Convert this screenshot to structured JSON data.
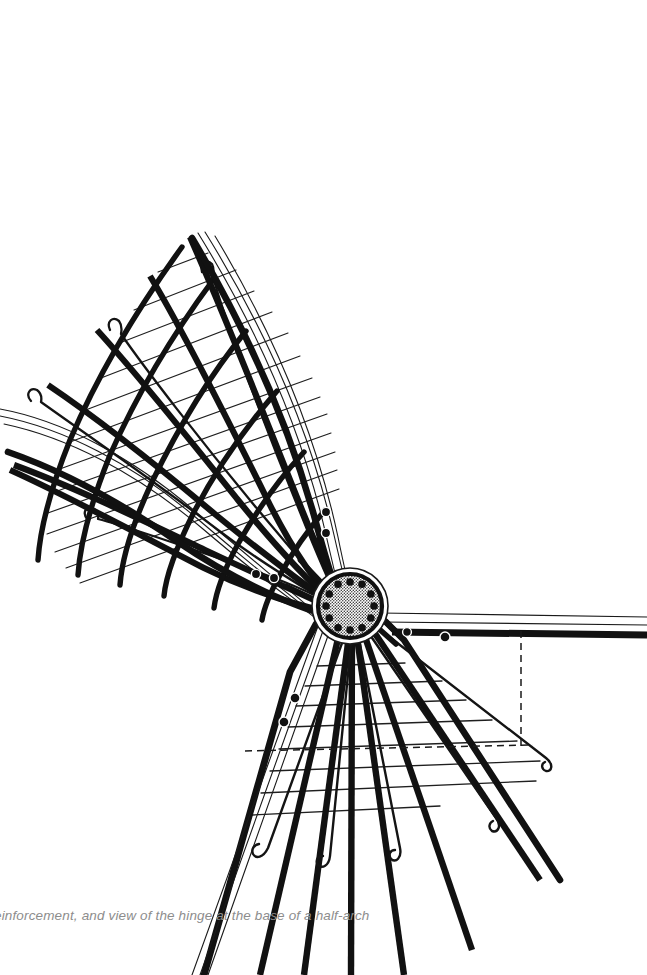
{
  "figure": {
    "caption": "einforcement, and view of the hinge at the base of a half-arch",
    "caption_clipped_left": true,
    "background_color": "#ffffff",
    "ink_color": "#111111",
    "thin_line_color": "#1a1a1a",
    "caption_color": "#8d8d8d",
    "canvas": {
      "width": 647,
      "height": 975
    }
  },
  "hinge": {
    "label": "pin-hinge-plate",
    "center_x": 350,
    "center_y": 606,
    "outer_radius": 37,
    "inner_radius": 30,
    "ring_thickness": 4,
    "bolt_count": 12,
    "bolt_radius": 3.6,
    "bolt_circle_radius": 23,
    "fill_pattern": "stipple-hatch",
    "fill_color": "#d8d8d8"
  },
  "upper_fan": {
    "label": "upper-half-arch-reinforcement-cage",
    "bar_count_radial": 7,
    "tie_count": 13,
    "hooked_bar_count": 5,
    "direction": "upper-left",
    "description": "Splayed fan of main reinforcement bars with transverse ties"
  },
  "lower_fan": {
    "label": "lower-half-arch-reinforcement-cage",
    "bar_count_radial": 8,
    "tie_count": 8,
    "hooked_bar_count": 5,
    "direction": "lower",
    "description": "Splayed fan of main reinforcement bars with horizontal ties"
  },
  "right_beam": {
    "label": "horizontal-tie-beam",
    "start_x": 392,
    "end_x": 647,
    "y": 628,
    "thickness": 7
  },
  "dashed_lines": {
    "horizontal": {
      "x1": 245,
      "y1": 751,
      "x2": 533,
      "y2": 745
    },
    "vertical": {
      "x1": 521,
      "y1": 631,
      "x2": 521,
      "y2": 749
    }
  },
  "bolt_markers": [
    {
      "x": 326,
      "y": 512
    },
    {
      "x": 326,
      "y": 533
    },
    {
      "x": 256,
      "y": 574
    },
    {
      "x": 274,
      "y": 578
    },
    {
      "x": 295,
      "y": 698
    },
    {
      "x": 284,
      "y": 722
    },
    {
      "x": 407,
      "y": 632
    },
    {
      "x": 445,
      "y": 637
    }
  ]
}
